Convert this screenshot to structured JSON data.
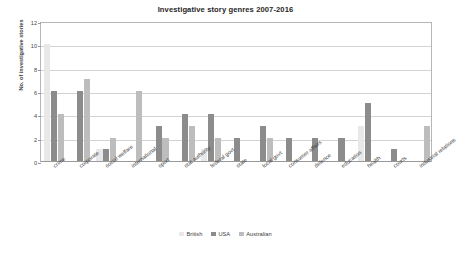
{
  "chart_data": {
    "type": "bar",
    "title": "Investigative story genres 2007-2016",
    "xlabel": "",
    "ylabel": "No. of investigative stories",
    "ylim": [
      0,
      12
    ],
    "ytick_step": 2,
    "yticks": [
      0,
      2,
      4,
      6,
      8,
      10,
      12
    ],
    "grid": true,
    "legend_position": "bottom",
    "categories": [
      "crime",
      "corporate",
      "social welfare",
      "international",
      "sport",
      "stat authority",
      "federal govt",
      "state",
      "local govt",
      "consumer affairs",
      "defence",
      "education",
      "health",
      "courts",
      "industrial relations"
    ],
    "series": [
      {
        "name": "British",
        "color": "#e8e8e8",
        "values": [
          10,
          0,
          1,
          0,
          0,
          0,
          1,
          0,
          0,
          0,
          0,
          0,
          3,
          0,
          0
        ]
      },
      {
        "name": "USA",
        "color": "#8c8c8c",
        "values": [
          6,
          6,
          1,
          0,
          3,
          4,
          4,
          2,
          3,
          2,
          2,
          2,
          5,
          1,
          0
        ]
      },
      {
        "name": "Australian",
        "color": "#bdbdbd",
        "values": [
          4,
          7,
          2,
          6,
          2,
          3,
          2,
          0,
          2,
          0,
          0,
          0,
          0,
          0,
          3
        ]
      }
    ]
  },
  "legend": {
    "items": [
      {
        "label": "British"
      },
      {
        "label": "USA"
      },
      {
        "label": "Australian"
      }
    ]
  }
}
